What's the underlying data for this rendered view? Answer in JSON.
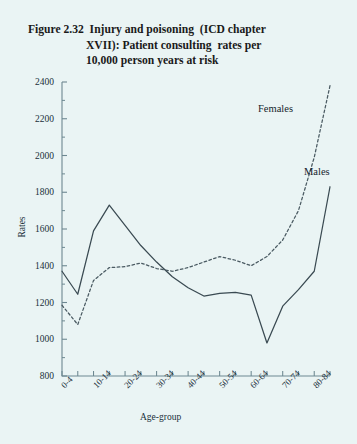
{
  "title": {
    "line1": "Figure 2.32  Injury and poisoning  (ICD chapter",
    "line2": "XVII): Patient consulting  rates per",
    "line3": "10,000 person years at risk"
  },
  "chart_data": {
    "type": "line",
    "title": "Figure 2.32  Injury and poisoning  (ICD chapter XVII): Patient consulting  rates per 10,000 person years at risk",
    "xlabel": "Age-group",
    "ylabel": "Rates",
    "ylim": [
      800,
      2400
    ],
    "ytick_labels": [
      "800",
      "1000",
      "1200",
      "1400",
      "1600",
      "1800",
      "2000",
      "2200",
      "2400"
    ],
    "ytick_values": [
      800,
      1000,
      1200,
      1400,
      1600,
      1800,
      2000,
      2200,
      2400
    ],
    "grid": false,
    "legend_position": "inline-right",
    "categories": [
      "0-4",
      "5-9",
      "10-14",
      "15-19",
      "20-24",
      "25-29",
      "30-34",
      "35-39",
      "40-44",
      "45-49",
      "50-54",
      "55-59",
      "60-64",
      "65-69",
      "70-74",
      "75-79",
      "80-84",
      "85+"
    ],
    "xtick_labels": [
      "0-4",
      "10-14",
      "20-24",
      "30-34",
      "40-44",
      "50-54",
      "60-64",
      "70-74",
      "80-84"
    ],
    "xtick_label_indices": [
      0,
      2,
      4,
      6,
      8,
      10,
      12,
      14,
      16
    ],
    "series": [
      {
        "name": "Males",
        "style": "solid",
        "color": "#3a4a52",
        "values": [
          1370,
          1245,
          1590,
          1730,
          1620,
          1510,
          1420,
          1340,
          1280,
          1235,
          1250,
          1255,
          1240,
          980,
          1180,
          1270,
          1370,
          1830
        ]
      },
      {
        "name": "Females",
        "style": "dashed",
        "color": "#4a5a62",
        "values": [
          1185,
          1080,
          1320,
          1390,
          1395,
          1415,
          1385,
          1370,
          1390,
          1420,
          1450,
          1430,
          1400,
          1450,
          1540,
          1700,
          1990,
          2380
        ]
      }
    ],
    "annotations": [
      {
        "text": "Females",
        "x_category": "75-79",
        "y_value": 2070
      },
      {
        "text": "Males",
        "x_category": "85+",
        "y_value": 1740
      }
    ]
  }
}
